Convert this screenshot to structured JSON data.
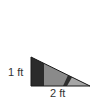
{
  "diagram": {
    "type": "right-triangle",
    "labels": {
      "height": "1 ft",
      "base": "2 ft"
    },
    "colors": {
      "outline": "#1a1a1a",
      "dark_section": "#2b2b2b",
      "middle_section": "#8a8a8a",
      "stripe": "#2e2e2e",
      "right_section": "#a6a6a6",
      "background": "#ffffff"
    }
  }
}
